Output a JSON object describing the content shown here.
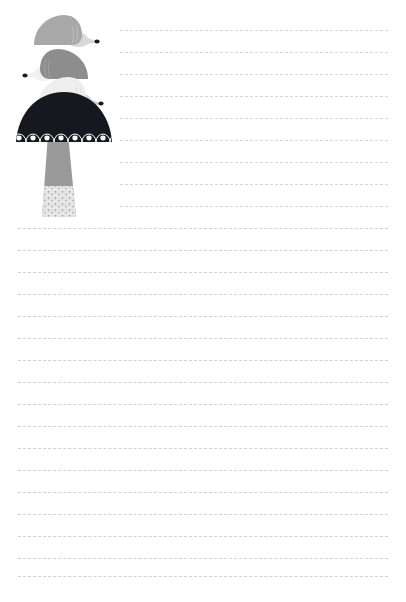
{
  "page": {
    "width": 406,
    "height": 602,
    "background_color": "#ffffff"
  },
  "illustration": {
    "name": "hedgehog-mushroom-stack",
    "description": "Three stacked stylized hedgehogs above a dark spotted mushroom cap with a tapering scaled stem",
    "palette": {
      "hedgehog_top_body": "#a8a8a8",
      "hedgehog_top_face": "#d8d8d8",
      "hedgehog_middle_body": "#8d8d8d",
      "hedgehog_middle_face": "#f1f1f1",
      "hedgehog_bottom_body": "#eeeeee",
      "hedgehog_bottom_face": "#d0d0d0",
      "snout_tip": "#1c1c1c",
      "eye": "#1c1c1c",
      "cap_dark": "#17171f",
      "cap_spot": "#ffffff",
      "stem_gray": "#9a9a9a",
      "stem_light": "#efefef"
    },
    "elements": [
      {
        "name": "hedgehog-top",
        "facing": "right",
        "body_color": "#a8a8a8",
        "face_color": "#d8d8d8"
      },
      {
        "name": "hedgehog-middle",
        "facing": "left",
        "body_color": "#8d8d8d",
        "face_color": "#f1f1f1"
      },
      {
        "name": "hedgehog-bottom",
        "facing": "right",
        "body_color": "#eeeeee",
        "face_color": "#d0d0d0"
      },
      {
        "name": "mushroom-cap",
        "color": "#17171f",
        "arch_count": 8,
        "spot_count": 8,
        "spot_color": "#ffffff"
      },
      {
        "name": "mushroom-stem",
        "color": "#9a9a9a",
        "scale_rows": 5
      }
    ]
  },
  "ruled_lines": {
    "style": "dashed",
    "color": "#cfcfd2",
    "dash_length": 4,
    "dash_gap": 3,
    "spacing": 22,
    "short_lines": {
      "count": 8,
      "x_start": 120,
      "x_end": 388,
      "y_positions": [
        30,
        52,
        74,
        96,
        118,
        140,
        162,
        184,
        206
      ]
    },
    "full_lines": {
      "count": 17,
      "x_start": 18,
      "x_end": 388,
      "y_positions": [
        228,
        250,
        272,
        294,
        316,
        338,
        360,
        382,
        404,
        426,
        448,
        470,
        492,
        514,
        536,
        558,
        576
      ]
    }
  }
}
